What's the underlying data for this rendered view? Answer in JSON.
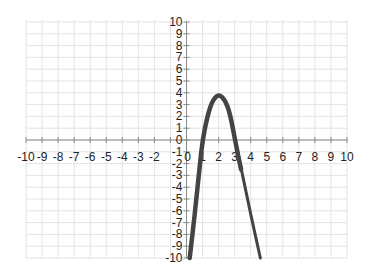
{
  "chart_data": {
    "type": "line",
    "title": "",
    "xlabel": "",
    "ylabel": "",
    "xlim": [
      -10,
      10
    ],
    "ylim": [
      -10,
      10
    ],
    "grid": true,
    "x_ticks": [
      -10,
      -9,
      -8,
      -7,
      -6,
      -5,
      -4,
      -3,
      -2,
      -1,
      0,
      1,
      2,
      3,
      4,
      5,
      6,
      7,
      8,
      9,
      10
    ],
    "y_ticks": [
      -10,
      -9,
      -8,
      -7,
      -6,
      -5,
      -4,
      -3,
      -2,
      -1,
      0,
      1,
      2,
      3,
      4,
      5,
      6,
      7,
      8,
      9,
      10
    ],
    "series": [
      {
        "name": "parabola",
        "color": "#444444",
        "description": "Hand-drawn downward parabola, vertex near (2, 4), x-intercepts near 1 and 3",
        "points": [
          [
            0.2,
            -10
          ],
          [
            0.5,
            -6.5
          ],
          [
            0.8,
            -2.5
          ],
          [
            1.0,
            0
          ],
          [
            1.3,
            2.0
          ],
          [
            1.6,
            3.3
          ],
          [
            2.0,
            3.9
          ],
          [
            2.4,
            3.4
          ],
          [
            2.7,
            2.3
          ],
          [
            3.0,
            0.2
          ],
          [
            3.2,
            -1.2
          ],
          [
            3.4,
            -2.5
          ]
        ]
      },
      {
        "name": "extension",
        "color": "#444444",
        "description": "Straight continuation of right branch",
        "points": [
          [
            3.0,
            0.2
          ],
          [
            3.5,
            -3.0
          ],
          [
            4.0,
            -6.3
          ],
          [
            4.6,
            -10
          ]
        ]
      }
    ]
  },
  "axes": {
    "x_labels": [
      "-10",
      "-9",
      "-8",
      "-7",
      "-6",
      "-5",
      "-4",
      "-3",
      "-2",
      "-1",
      "0",
      "1",
      "2",
      "3",
      "4",
      "5",
      "6",
      "7",
      "8",
      "9",
      "10"
    ],
    "y_labels": [
      "10",
      "9",
      "8",
      "7",
      "6",
      "5",
      "4",
      "3",
      "2",
      "1",
      "0",
      "-1",
      "-2",
      "-3",
      "-4",
      "-5",
      "-6",
      "-7",
      "-8",
      "-9",
      "-10"
    ]
  },
  "colors": {
    "grid": "#e3e3e3",
    "axis": "#8a8a8a",
    "curve": "#444444",
    "text": "#222222"
  }
}
